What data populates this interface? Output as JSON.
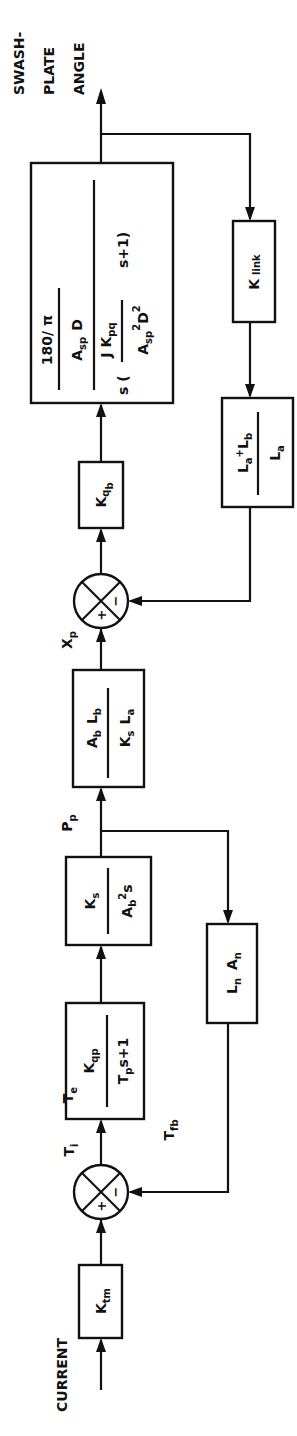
{
  "diagram": {
    "type": "block-diagram",
    "orientation": "rotated-90-ccw",
    "flow": "bottom-to-top",
    "input_label": "CURRENT",
    "output_label": [
      "SWASH-",
      "PLATE",
      "ANGLE"
    ],
    "signals": {
      "ti": {
        "main": "T",
        "sub": "i"
      },
      "te": {
        "main": "T",
        "sub": "e"
      },
      "tfb": {
        "main": "T",
        "sub": "fb"
      },
      "pp": {
        "main": "P",
        "sub": "p"
      },
      "xp": {
        "main": "X",
        "sub": "p"
      }
    },
    "blocks": {
      "ktm": {
        "main": "K",
        "sub": "tm"
      },
      "valve": {
        "num_main": "K",
        "num_sub": "qp",
        "den_main": "T",
        "den_sub": "p",
        "den_rest": "s+1"
      },
      "pressure": {
        "num_main": "K",
        "num_sub": "s",
        "den_main": "A",
        "den_sub": "b",
        "den_sup": "2",
        "den_rest": "s"
      },
      "spool": {
        "num": [
          "A",
          "b",
          "L",
          "b"
        ],
        "den": [
          "K",
          "s",
          "L",
          "a"
        ]
      },
      "kqb": {
        "main": "K",
        "sub": "q",
        "subsub": "b"
      },
      "plant": {
        "outer_num_top": "180/ π",
        "outer_num_bottom_main": "A",
        "outer_num_bottom_sub": "sp",
        "outer_num_bottom_rest": "D",
        "inner_num": "J K",
        "inner_num_sub": "pq",
        "den_prefix": "s (",
        "den_frac_main": "A",
        "den_frac_sub": "sp",
        "den_frac_sup": "2",
        "den_frac_rest": "D",
        "den_frac_sup2": "2",
        "den_suffix": "s+1)"
      },
      "klink": {
        "main": "K",
        "sub": "link"
      },
      "lever": {
        "num": "L",
        "num_sub_a": "a",
        "plus": "+",
        "num2": "L",
        "num_sub_b": "b",
        "den": "L",
        "den_sub": "a"
      },
      "lnan": {
        "l": "L",
        "l_sub": "n",
        "a": "A",
        "a_sub": "n"
      }
    },
    "summing_junctions": [
      {
        "id": "sum1",
        "plus": "+",
        "minus": "−"
      },
      {
        "id": "sum2",
        "plus": "+",
        "minus": "−"
      }
    ]
  }
}
